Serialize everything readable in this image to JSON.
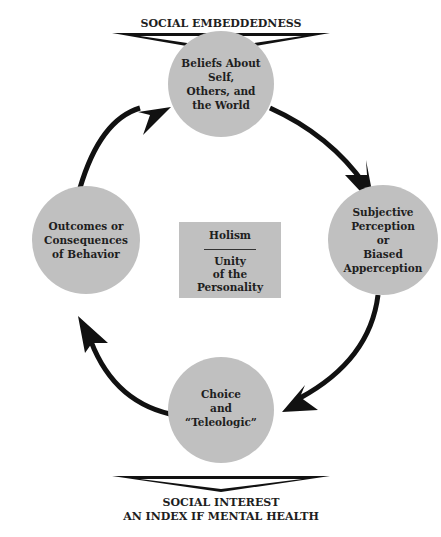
{
  "top_banner": {
    "label": "SOCIAL EMBEDDEDNESS"
  },
  "bottom_banner": {
    "line1": "SOCIAL INTEREST",
    "line2": "AN INDEX IF MENTAL HEALTH"
  },
  "nodes": [
    {
      "id": "beliefs",
      "lines": [
        "Beliefs About Self,",
        "Others, and",
        "the World"
      ]
    },
    {
      "id": "perception",
      "lines": [
        "Subjective Perception",
        "or",
        "Biased Apperception"
      ]
    },
    {
      "id": "choice",
      "lines": [
        "Choice",
        "and",
        "“Teleologic”"
      ]
    },
    {
      "id": "outcomes",
      "lines": [
        "Outcomes or",
        "Consequences",
        "of Behavior"
      ]
    }
  ],
  "center": {
    "title": "Holism",
    "subtitle_lines": [
      "Unity",
      "of the",
      "Personality"
    ]
  },
  "colors": {
    "node_fill": "#c0c0c0",
    "arrow": "#111111",
    "background": "#ffffff"
  },
  "cycle_direction": "clockwise"
}
